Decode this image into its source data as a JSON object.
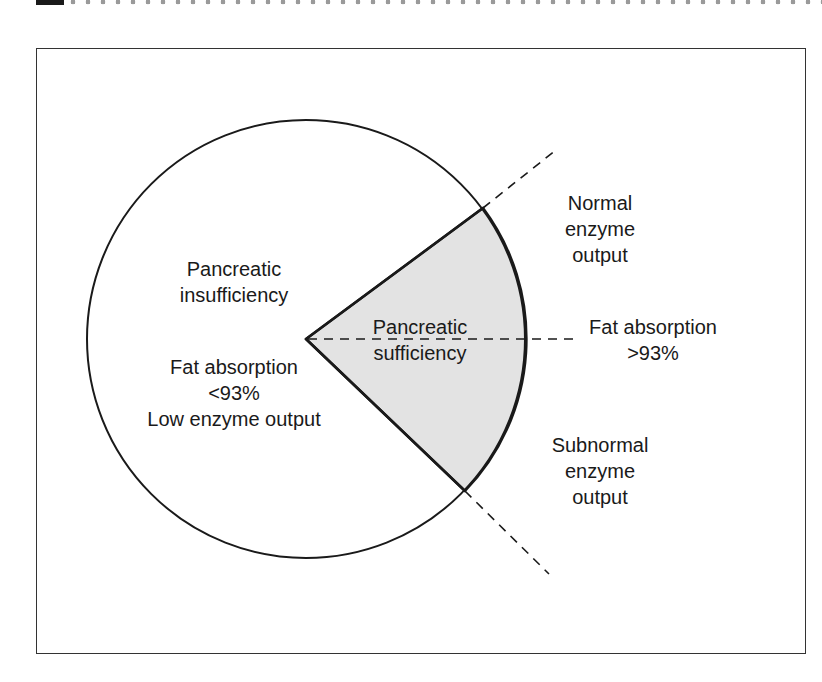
{
  "colors": {
    "wedge_fill": "#e3e3e3",
    "stroke": "#1a1a1a",
    "background": "#ffffff"
  },
  "diagram": {
    "type": "circle-with-wedge",
    "regions": {
      "insufficiency": {
        "title_line1": "Pancreatic",
        "title_line2": "insufficiency",
        "detail_line1": "Fat absorption",
        "detail_line2": "<93%",
        "detail_line3": "Low enzyme output"
      },
      "sufficiency": {
        "line1": "Pancreatic",
        "line2": "sufficiency"
      }
    },
    "outside_labels": {
      "normal": {
        "line1": "Normal",
        "line2": "enzyme",
        "line3": "output"
      },
      "fat_absorption_high": {
        "line1": "Fat absorption",
        "line2": ">93%"
      },
      "subnormal": {
        "line1": "Subnormal",
        "line2": "enzyme",
        "line3": "output"
      }
    }
  }
}
